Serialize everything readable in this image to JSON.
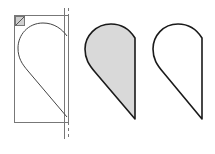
{
  "diagram": {
    "colors": {
      "background": "#ffffff",
      "stroke": "#1a1a1a",
      "guide_stroke": "#777777",
      "fill": "#d9d9d9"
    },
    "panels": [
      {
        "id": "construction",
        "label": "Shape with bounding frame and guide lines"
      },
      {
        "id": "filled",
        "label": "Shape filled gray"
      },
      {
        "id": "outline",
        "label": "Shape outline only"
      }
    ]
  }
}
